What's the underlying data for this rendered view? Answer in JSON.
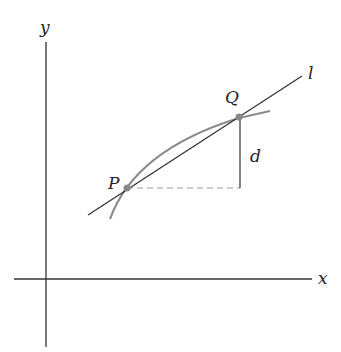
{
  "labels": {
    "y_axis": "y",
    "x_axis": "x",
    "line": "l",
    "point_p": "P",
    "point_q": "Q",
    "distance": "d"
  },
  "colors": {
    "axis": "#333333",
    "curve": "#8c8c8c",
    "dashed": "#999999",
    "point": "#888888"
  }
}
